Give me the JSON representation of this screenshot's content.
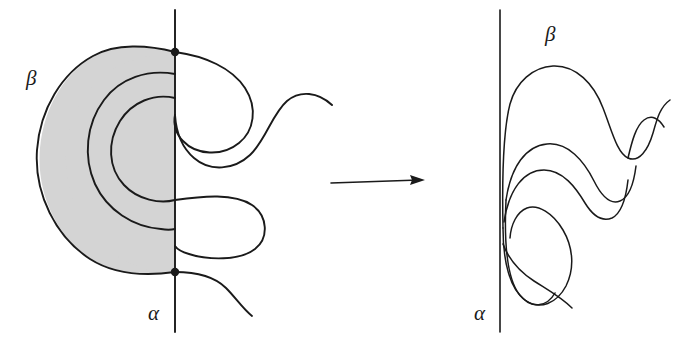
{
  "figure": {
    "type": "diagram",
    "background_color": "#ffffff",
    "stroke_color": "#1a1a1a",
    "shade_color": "#d4d4d4",
    "panels": [
      {
        "id": "left",
        "name": "before",
        "shaded": true,
        "axis_line": {
          "label": "α",
          "x": 175,
          "y1": 10,
          "y2": 332
        },
        "curve_label": "β",
        "intersection_dots": [
          {
            "x": 175,
            "y": 52
          },
          {
            "x": 175,
            "y": 272
          }
        ],
        "labels": {
          "alpha": {
            "text": "α",
            "x": 148,
            "y": 303
          },
          "beta": {
            "text": "β",
            "x": 26,
            "y": 68
          }
        }
      },
      {
        "id": "right",
        "name": "after",
        "shaded": false,
        "axis_line": {
          "label": "α",
          "x": 500,
          "y1": 10,
          "y2": 332
        },
        "curve_label": "β",
        "intersection_dots": [],
        "labels": {
          "alpha": {
            "text": "α",
            "x": 474,
            "y": 303
          },
          "beta": {
            "text": "β",
            "x": 545,
            "y": 24
          }
        }
      }
    ],
    "arrow": {
      "name": "transformation-arrow",
      "x1": 331,
      "y1": 183,
      "x2": 425,
      "y2": 180
    }
  }
}
